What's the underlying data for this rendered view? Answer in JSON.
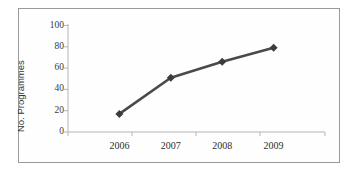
{
  "chart_data": {
    "type": "line",
    "title": "",
    "subtitle": "",
    "xlabel": "",
    "ylabel": "No. Programmes",
    "categories": [
      "2006",
      "2007",
      "2008",
      "2009"
    ],
    "values": [
      17,
      51,
      66,
      79
    ],
    "series": [
      {
        "name": "No. Programmes",
        "values": [
          17,
          51,
          66,
          79
        ]
      }
    ],
    "ylim": [
      0,
      100
    ],
    "yticks": [
      "0",
      "20",
      "40",
      "60",
      "80",
      "100"
    ],
    "ytick_values": [
      0,
      20,
      40,
      60,
      80,
      100
    ],
    "xticks": [
      "2006",
      "2007",
      "2008",
      "2009"
    ],
    "grid": false,
    "legend": "none",
    "marker": "diamond",
    "colors": {
      "line": "#4a4a4a",
      "marker": "#3c3c3c",
      "axis": "#b2b2b2",
      "tick_text": "#333333",
      "frame": "#9a9a9a",
      "background": "#ffffff"
    }
  },
  "figure": {
    "alt": "Line chart of number of programmes by year"
  }
}
